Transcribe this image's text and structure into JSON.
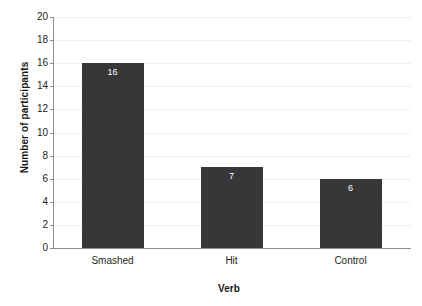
{
  "chart_data": {
    "type": "bar",
    "title": "",
    "categories": [
      "Smashed",
      "Hit",
      "Control"
    ],
    "values": [
      16,
      7,
      6
    ],
    "xlabel": "Verb",
    "ylabel": "Number of participants",
    "ylim": [
      0,
      20
    ],
    "ytick_labels": [
      "0",
      "2",
      "4",
      "6",
      "8",
      "10",
      "12",
      "14",
      "16",
      "18",
      "20"
    ],
    "ytick_values": [
      0,
      2,
      4,
      6,
      8,
      10,
      12,
      14,
      16,
      18,
      20
    ],
    "grid": true,
    "legend": null,
    "bar_color": "#37373a",
    "data_label_color": "#ffffff",
    "axis_color": "#8c8c8c",
    "gridline_color": "#efefef",
    "background": "#ffffff",
    "data_labels": [
      "16",
      "7",
      "6"
    ]
  }
}
